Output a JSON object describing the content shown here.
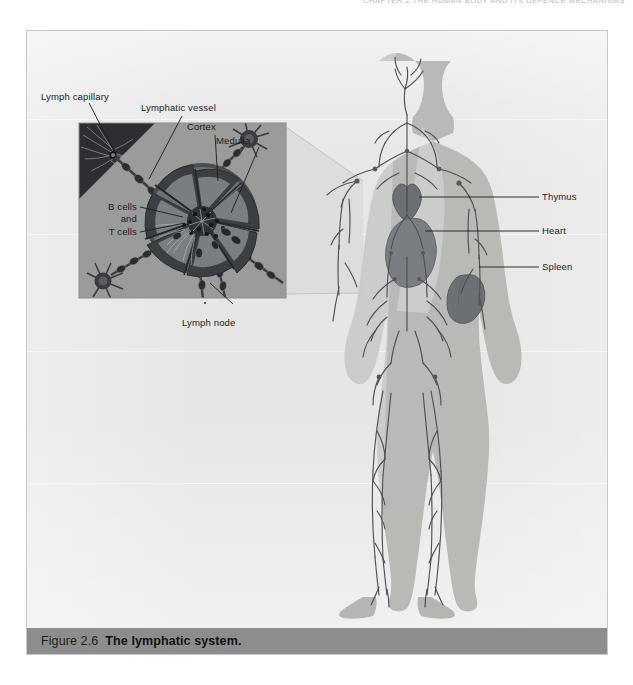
{
  "running_head": {
    "text": "CHAPTER 2   THE HUMAN BODY AND ITS DEFENCE MECHANISMS"
  },
  "figure": {
    "caption_number": "Figure 2.6",
    "caption_title": "The lymphatic system.",
    "caption_bar_color": "#8d8d8d",
    "card_background": "#e6e6e6",
    "body_silhouette_color": "#b4b6b2",
    "vessel_line_color": "#4d4f52",
    "organ_color": "#6e7176"
  },
  "inset": {
    "title": "lymph-node-cross-section",
    "background": "#9b9d9a",
    "capillary_wedge_color": "#2e3033",
    "node_body_color": "#6a6d70",
    "node_rim_color": "#4a4d50"
  },
  "labels": {
    "lymph_capillary": "Lymph capillary",
    "lymphatic_vessel": "Lymphatic vessel",
    "cortex": "Cortex",
    "medulla": "Medulla",
    "b_cells": "B cells",
    "and": "and",
    "t_cells": "T cells",
    "lymph_node": "Lymph node",
    "thymus": "Thymus",
    "heart": "Heart",
    "spleen": "Spleen"
  }
}
